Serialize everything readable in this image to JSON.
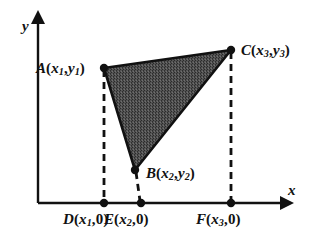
{
  "figure": {
    "type": "geometry-diagram",
    "background_color": "#ffffff",
    "stroke_color": "#111111",
    "fill_color": "#4a4a4a",
    "axes": {
      "x_label": "x",
      "y_label": "y",
      "origin_px": {
        "x": 38,
        "y": 203
      },
      "x_axis_end_px": {
        "x": 284,
        "y": 203
      },
      "y_axis_end_px": {
        "x": 38,
        "y": 20
      }
    },
    "vertices": [
      {
        "id": "A",
        "label_main": "A",
        "sub1": "1",
        "sub2": "1",
        "x_var": "x",
        "y_var": "y",
        "px": {
          "x": 104,
          "y": 68
        },
        "full_label": "A(x1, y1)"
      },
      {
        "id": "B",
        "label_main": "B",
        "sub1": "2",
        "sub2": "2",
        "x_var": "x",
        "y_var": "y",
        "px": {
          "x": 135,
          "y": 170
        },
        "full_label": "B(x2, y2)"
      },
      {
        "id": "C",
        "label_main": "C",
        "sub1": "3",
        "sub2": "3",
        "x_var": "x",
        "y_var": "y",
        "px": {
          "x": 231,
          "y": 50
        },
        "full_label": "C(x3, y3)"
      }
    ],
    "foot_points": [
      {
        "id": "D",
        "label_main": "D",
        "sub": "1",
        "x_var": "x",
        "zero": "0",
        "px": {
          "x": 104,
          "y": 203
        },
        "full_label": "D(x1, 0)"
      },
      {
        "id": "E",
        "label_main": "E",
        "sub": "2",
        "x_var": "x",
        "zero": "0",
        "px": {
          "x": 141,
          "y": 203
        },
        "full_label": "E(x2, 0)"
      },
      {
        "id": "F",
        "label_main": "F",
        "sub": "3",
        "x_var": "x",
        "zero": "0",
        "px": {
          "x": 231,
          "y": 203
        },
        "full_label": "F(x3, 0)"
      }
    ],
    "dashed_drops": [
      {
        "from": "A",
        "to": "D"
      },
      {
        "from": "B",
        "to": "E"
      },
      {
        "from": "C",
        "to": "F"
      }
    ],
    "punctuation": {
      "open_paren": "(",
      "close_paren": ")",
      "comma": ",",
      "zero": "0"
    }
  }
}
